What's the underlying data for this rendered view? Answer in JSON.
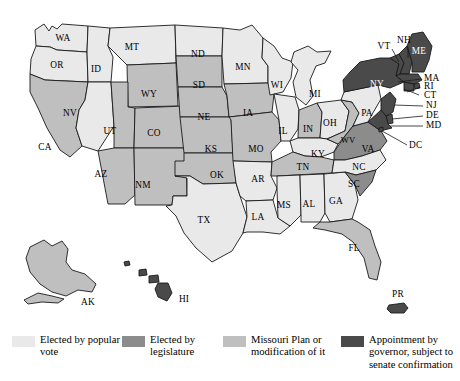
{
  "figure": {
    "kind": "choropleth-map"
  },
  "colors": {
    "popular_vote": "#e9e9e9",
    "legislature": "#8c8c8c",
    "missouri_plan": "#bfbfbf",
    "governor_appointment": "#4a4a4a",
    "border": "#1a1a1a",
    "background": "#ffffff",
    "label_text": "#000000"
  },
  "legend": {
    "items": [
      {
        "label": "Elected by popular vote",
        "category": "popular_vote",
        "color": "#e9e9e9"
      },
      {
        "label": "Elected by legislature",
        "category": "legislature",
        "color": "#8c8c8c"
      },
      {
        "label": "Missouri Plan or modification of it",
        "category": "missouri_plan",
        "color": "#bfbfbf"
      },
      {
        "label": "Appointment by governor, subject to senate confirmation",
        "category": "governor_appointment",
        "color": "#4a4a4a"
      }
    ]
  },
  "map_data": {
    "type": "choropleth",
    "region": "United States including AK, HI, PR and DC",
    "categories": [
      "popular_vote",
      "legislature",
      "missouri_plan",
      "governor_appointment"
    ],
    "states": [
      {
        "code": "WA",
        "category": "popular_vote"
      },
      {
        "code": "OR",
        "category": "popular_vote"
      },
      {
        "code": "ID",
        "category": "popular_vote"
      },
      {
        "code": "MT",
        "category": "popular_vote"
      },
      {
        "code": "ND",
        "category": "popular_vote"
      },
      {
        "code": "MN",
        "category": "popular_vote"
      },
      {
        "code": "WI",
        "category": "popular_vote"
      },
      {
        "code": "MI",
        "category": "popular_vote"
      },
      {
        "code": "IL",
        "category": "popular_vote"
      },
      {
        "code": "OH",
        "category": "popular_vote"
      },
      {
        "code": "PA",
        "category": "popular_vote"
      },
      {
        "code": "KY",
        "category": "popular_vote"
      },
      {
        "code": "NC",
        "category": "popular_vote"
      },
      {
        "code": "GA",
        "category": "popular_vote"
      },
      {
        "code": "AL",
        "category": "popular_vote"
      },
      {
        "code": "MS",
        "category": "popular_vote"
      },
      {
        "code": "LA",
        "category": "popular_vote"
      },
      {
        "code": "AR",
        "category": "popular_vote"
      },
      {
        "code": "TX",
        "category": "popular_vote"
      },
      {
        "code": "NV",
        "category": "popular_vote"
      },
      {
        "code": "WV",
        "category": "missouri_plan"
      },
      {
        "code": "CA",
        "category": "missouri_plan"
      },
      {
        "code": "AZ",
        "category": "missouri_plan"
      },
      {
        "code": "NM",
        "category": "missouri_plan"
      },
      {
        "code": "UT",
        "category": "missouri_plan"
      },
      {
        "code": "CO",
        "category": "missouri_plan"
      },
      {
        "code": "WY",
        "category": "missouri_plan"
      },
      {
        "code": "SD",
        "category": "missouri_plan"
      },
      {
        "code": "NE",
        "category": "missouri_plan"
      },
      {
        "code": "KS",
        "category": "missouri_plan"
      },
      {
        "code": "OK",
        "category": "missouri_plan"
      },
      {
        "code": "IA",
        "category": "missouri_plan"
      },
      {
        "code": "MO",
        "category": "missouri_plan"
      },
      {
        "code": "IN",
        "category": "missouri_plan"
      },
      {
        "code": "TN",
        "category": "missouri_plan"
      },
      {
        "code": "FL",
        "category": "missouri_plan"
      },
      {
        "code": "AK",
        "category": "missouri_plan"
      },
      {
        "code": "VA",
        "category": "legislature"
      },
      {
        "code": "SC",
        "category": "legislature"
      },
      {
        "code": "ME",
        "category": "governor_appointment"
      },
      {
        "code": "NH",
        "category": "governor_appointment"
      },
      {
        "code": "VT",
        "category": "governor_appointment"
      },
      {
        "code": "MA",
        "category": "governor_appointment"
      },
      {
        "code": "RI",
        "category": "governor_appointment"
      },
      {
        "code": "CT",
        "category": "governor_appointment"
      },
      {
        "code": "NY",
        "category": "governor_appointment"
      },
      {
        "code": "NJ",
        "category": "governor_appointment"
      },
      {
        "code": "DE",
        "category": "governor_appointment"
      },
      {
        "code": "MD",
        "category": "governor_appointment"
      },
      {
        "code": "DC",
        "category": "governor_appointment"
      },
      {
        "code": "HI",
        "category": "governor_appointment"
      },
      {
        "code": "PR",
        "category": "governor_appointment"
      }
    ]
  },
  "labels": {
    "WA": "WA",
    "OR": "OR",
    "ID": "ID",
    "MT": "MT",
    "ND": "ND",
    "MN": "MN",
    "WI": "WI",
    "MI": "MI",
    "IL": "IL",
    "OH": "OH",
    "PA": "PA",
    "KY": "KY",
    "NC": "NC",
    "GA": "GA",
    "AL": "AL",
    "MS": "MS",
    "LA": "LA",
    "AR": "AR",
    "TX": "TX",
    "NV": "NV",
    "CA": "CA",
    "AZ": "AZ",
    "NM": "NM",
    "UT": "UT",
    "CO": "CO",
    "WY": "WY",
    "SD": "SD",
    "NE": "NE",
    "KS": "KS",
    "OK": "OK",
    "IA": "IA",
    "MO": "MO",
    "IN": "IN",
    "TN": "TN",
    "FL": "FL",
    "WV": "WV",
    "VA": "VA",
    "SC": "SC",
    "ME": "ME",
    "NH": "NH",
    "VT": "VT",
    "MA": "MA",
    "RI": "RI",
    "CT": "CT",
    "NY": "NY",
    "NJ": "NJ",
    "DE": "DE",
    "MD": "MD",
    "DC": "DC",
    "AK": "AK",
    "HI": "HI",
    "PR": "PR"
  }
}
